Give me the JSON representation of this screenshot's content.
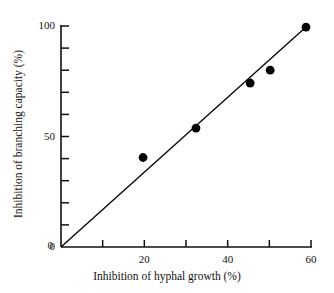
{
  "chart_data": {
    "type": "scatter",
    "title": "",
    "xlabel": "Inhibition of hyphal growth (%)",
    "ylabel": "Inhibition of branching capacity (%)",
    "xlim": [
      0,
      60
    ],
    "ylim": [
      0,
      100
    ],
    "grid": false,
    "legend": "none",
    "x_major_ticks": [
      0,
      20,
      40,
      60
    ],
    "x_major_tick_labels": [
      "0",
      "20",
      "40",
      "60"
    ],
    "x_minor_ticks": [
      10,
      30,
      50
    ],
    "y_major_ticks": [
      0,
      50,
      100
    ],
    "y_major_tick_labels": [
      "0",
      "50",
      "100"
    ],
    "y_minor_ticks": [
      10,
      20,
      30,
      40,
      60,
      70,
      80,
      90
    ],
    "series": [
      {
        "name": "observations",
        "marker": "filled-circle",
        "color": "#000000",
        "points": [
          {
            "x": 19.7,
            "y": 40.5
          },
          {
            "x": 32.4,
            "y": 53.8
          },
          {
            "x": 45.4,
            "y": 74.2
          },
          {
            "x": 50.2,
            "y": 80.0
          },
          {
            "x": 58.8,
            "y": 99.5
          }
        ]
      }
    ],
    "trendline": {
      "name": "regression-line",
      "color": "#000000",
      "from": {
        "x": 0,
        "y": 0
      },
      "to": {
        "x": 58.8,
        "y": 99.5
      }
    }
  },
  "axes": {
    "x_labels": [
      {
        "text": "0",
        "value": 0
      },
      {
        "text": "20",
        "value": 20
      },
      {
        "text": "40",
        "value": 40
      },
      {
        "text": "60",
        "value": 60
      }
    ],
    "y_labels": [
      {
        "text": "0",
        "value": 0
      },
      {
        "text": "50",
        "value": 50
      },
      {
        "text": "100",
        "value": 100
      }
    ]
  }
}
